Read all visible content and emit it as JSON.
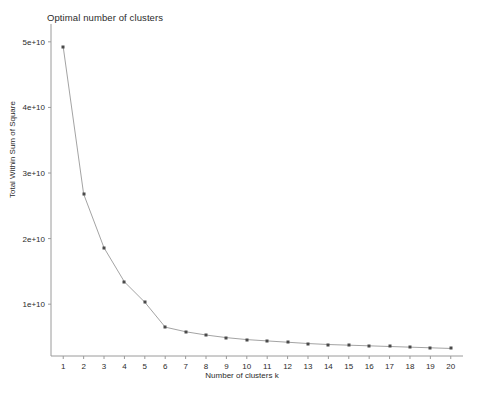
{
  "chart_data": {
    "type": "line",
    "title": "Optimal number of clusters",
    "xlabel": "Number of clusters k",
    "ylabel": "Total Within Sum of Square",
    "x": [
      1,
      2,
      3,
      4,
      5,
      6,
      7,
      8,
      9,
      10,
      11,
      12,
      13,
      14,
      15,
      16,
      17,
      18,
      19,
      20
    ],
    "values": [
      49200000000,
      26800000000,
      18600000000,
      13400000000,
      10300000000,
      6500000000,
      5800000000,
      5300000000,
      4900000000,
      4600000000,
      4400000000,
      4200000000,
      4000000000,
      3850000000,
      3750000000,
      3650000000,
      3550000000,
      3450000000,
      3350000000,
      3250000000
    ],
    "xtick_labels": [
      "1",
      "2",
      "3",
      "4",
      "5",
      "6",
      "7",
      "8",
      "9",
      "10",
      "11",
      "12",
      "13",
      "14",
      "15",
      "16",
      "17",
      "18",
      "19",
      "20"
    ],
    "ytick_labels": [
      "1e+10",
      "2e+10",
      "3e+10",
      "4e+10",
      "5e+10"
    ],
    "ytick_values": [
      10000000000,
      20000000000,
      30000000000,
      40000000000,
      50000000000
    ],
    "xlim": [
      0.4,
      20.6
    ],
    "ylim": [
      2100000000,
      51500000000
    ],
    "grid": false,
    "legend": false,
    "marker_style": "square",
    "series_name": "Total Within Sum of Square",
    "colors": {
      "line": "#8c8c8c",
      "marker": "#4a4a4a",
      "axis": "#9a9a9a",
      "text": "#2b2b2b",
      "background": "#ffffff"
    }
  }
}
